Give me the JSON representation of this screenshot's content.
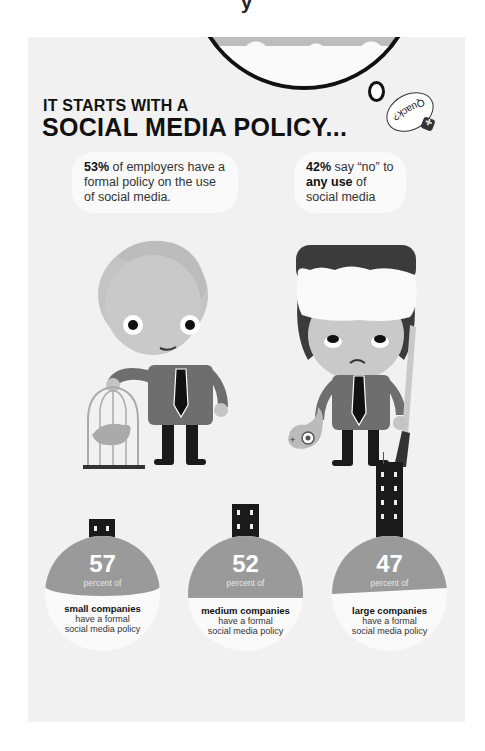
{
  "top_fragment": "y",
  "header": {
    "title_line1": "IT STARTS WITH  A",
    "title_line2": "SOCIAL MEDIA POLICY...",
    "quack": "Quack?"
  },
  "quotes": [
    {
      "stat": "53%",
      "text_pre": " of employers have a formal policy on the use of social media."
    },
    {
      "stat": "42%",
      "text_mid": " say “no” to ",
      "emph": "any use",
      "text_post": " of social media"
    }
  ],
  "characters": [
    {
      "name": "employee-with-birdcage",
      "prop": "bird cage with twitter bird"
    },
    {
      "name": "hunter-with-shotgun",
      "prop": "shot bird and rifle"
    }
  ],
  "stats": [
    {
      "value": "57",
      "unit": "percent of",
      "group": "small companies",
      "rest1": "have a formal",
      "rest2": "social media policy"
    },
    {
      "value": "52",
      "unit": "percent of",
      "group": "medium companies",
      "rest1": "have a formal",
      "rest2": "social media policy"
    },
    {
      "value": "47",
      "unit": "percent of",
      "group": "large companies",
      "rest1": "have a formal",
      "rest2": "social media policy"
    }
  ],
  "colors": {
    "panel": "#f1f1f1",
    "circle_fill": "#9a9a9a",
    "circle_bg": "#fafafa",
    "ink": "#111111"
  }
}
